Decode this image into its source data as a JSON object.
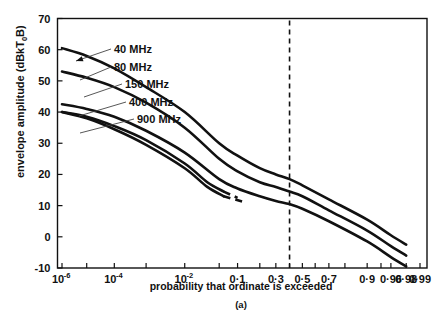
{
  "chart_data": {
    "type": "line",
    "title": "",
    "caption": "(a)",
    "xlabel": "probability that ordinate is exceeded",
    "ylabel": "envelope amplitude  (dBkT",
    "ylabel_sub": "0",
    "ylabel_tail": "B)",
    "ylabel_full": "envelope amplitude (dBkT0B)",
    "ylim": [
      -10,
      70
    ],
    "grid": false,
    "legend_position": "inline-annotations",
    "y_ticks": [
      70,
      60,
      50,
      40,
      30,
      20,
      10,
      0,
      -10
    ],
    "y_tick_labels": [
      "70",
      "60",
      "50",
      "40",
      "30",
      "20",
      "10",
      "0",
      "-10"
    ],
    "x_scale": "probability (normal / Rayleigh paper)",
    "x_tick_labels": [
      {
        "base": "10",
        "exp": "-6",
        "p": 1e-06
      },
      {
        "base": "10",
        "exp": "-4",
        "p": 0.0001
      },
      {
        "base": "10",
        "exp": "-2",
        "p": 0.01
      },
      {
        "base": "0·1",
        "exp": "",
        "p": 0.1
      },
      {
        "base": "0·3",
        "exp": "",
        "p": 0.3
      },
      {
        "base": "0·5",
        "exp": "",
        "p": 0.5
      },
      {
        "base": "0·7",
        "exp": "",
        "p": 0.7
      },
      {
        "base": "0·9",
        "exp": "",
        "p": 0.9
      },
      {
        "base": "0·96",
        "exp": "",
        "p": 0.96
      },
      {
        "base": "0·98",
        "exp": "",
        "p": 0.98
      },
      {
        "base": "0·99",
        "exp": "",
        "p": 0.99
      }
    ],
    "reference_line": {
      "label": "",
      "p": 0.4,
      "style": "dashed",
      "orientation": "vertical"
    },
    "series": [
      {
        "name": "40 MHz",
        "label": "40 MHz",
        "points": [
          {
            "p": 1e-06,
            "v": 60.5
          },
          {
            "p": 1e-05,
            "v": 58.0
          },
          {
            "p": 0.0001,
            "v": 54.0
          },
          {
            "p": 0.001,
            "v": 48.0
          },
          {
            "p": 0.01,
            "v": 40.0
          },
          {
            "p": 0.05,
            "v": 30.0
          },
          {
            "p": 0.1,
            "v": 26.0
          },
          {
            "p": 0.2,
            "v": 22.0
          },
          {
            "p": 0.3,
            "v": 20.0
          },
          {
            "p": 0.4,
            "v": 18.5
          },
          {
            "p": 0.5,
            "v": 16.5
          },
          {
            "p": 0.7,
            "v": 12.0
          },
          {
            "p": 0.9,
            "v": 5.5
          },
          {
            "p": 0.96,
            "v": 0.5
          },
          {
            "p": 0.98,
            "v": -2.5
          }
        ]
      },
      {
        "name": "80 MHz",
        "label": "80 MHz",
        "points": [
          {
            "p": 1e-06,
            "v": 53.0
          },
          {
            "p": 1e-05,
            "v": 51.0
          },
          {
            "p": 0.0001,
            "v": 48.0
          },
          {
            "p": 0.001,
            "v": 43.0
          },
          {
            "p": 0.01,
            "v": 35.0
          },
          {
            "p": 0.05,
            "v": 25.0
          },
          {
            "p": 0.1,
            "v": 21.0
          },
          {
            "p": 0.2,
            "v": 17.5
          },
          {
            "p": 0.3,
            "v": 16.0
          },
          {
            "p": 0.4,
            "v": 14.5
          },
          {
            "p": 0.5,
            "v": 13.0
          },
          {
            "p": 0.7,
            "v": 8.5
          },
          {
            "p": 0.9,
            "v": 2.0
          },
          {
            "p": 0.96,
            "v": -3.0
          },
          {
            "p": 0.98,
            "v": -6.0
          }
        ]
      },
      {
        "name": "150 MHz",
        "label": "150 MHz",
        "points": [
          {
            "p": 1e-06,
            "v": 42.5
          },
          {
            "p": 1e-05,
            "v": 41.0
          },
          {
            "p": 0.0001,
            "v": 38.5
          },
          {
            "p": 0.001,
            "v": 34.0
          },
          {
            "p": 0.01,
            "v": 27.0
          },
          {
            "p": 0.05,
            "v": 18.5
          },
          {
            "p": 0.1,
            "v": 15.5
          },
          {
            "p": 0.2,
            "v": 13.0
          },
          {
            "p": 0.3,
            "v": 11.5
          },
          {
            "p": 0.4,
            "v": 10.5
          },
          {
            "p": 0.5,
            "v": 9.0
          },
          {
            "p": 0.7,
            "v": 5.0
          },
          {
            "p": 0.9,
            "v": -1.5
          },
          {
            "p": 0.96,
            "v": -6.5
          },
          {
            "p": 0.98,
            "v": -9.5
          }
        ]
      },
      {
        "name": "400 MHz",
        "label": "400 MHz",
        "dashed_tail": true,
        "points": [
          {
            "p": 1e-06,
            "v": 40.0
          },
          {
            "p": 1e-05,
            "v": 38.5
          },
          {
            "p": 0.0001,
            "v": 35.5
          },
          {
            "p": 0.001,
            "v": 31.0
          },
          {
            "p": 0.01,
            "v": 23.5
          },
          {
            "p": 0.03,
            "v": 17.5
          },
          {
            "p": 0.06,
            "v": 14.5
          },
          {
            "p": 0.1,
            "v": 12.5
          }
        ]
      },
      {
        "name": "900 MHz",
        "label": "900 MHz",
        "dashed_tail": true,
        "points": [
          {
            "p": 1e-06,
            "v": 40.0
          },
          {
            "p": 1e-05,
            "v": 38.0
          },
          {
            "p": 0.0001,
            "v": 34.5
          },
          {
            "p": 0.001,
            "v": 29.5
          },
          {
            "p": 0.01,
            "v": 22.0
          },
          {
            "p": 0.03,
            "v": 16.0
          },
          {
            "p": 0.06,
            "v": 13.0
          },
          {
            "p": 0.13,
            "v": 11.0
          }
        ]
      }
    ],
    "annotations": [
      {
        "text": "40 MHz",
        "lx": 111,
        "ly": 49,
        "tx": 76,
        "ty": 61,
        "arrow": true
      },
      {
        "text": "80 MHz",
        "lx": 111,
        "ly": 67,
        "tx": 80,
        "ty": 80,
        "arrow": false
      },
      {
        "text": "150 MHz",
        "lx": 122,
        "ly": 84,
        "tx": 84,
        "ty": 97,
        "arrow": false
      },
      {
        "text": "400 MHz",
        "lx": 126,
        "ly": 102,
        "tx": 79,
        "ty": 116,
        "arrow": false
      },
      {
        "text": "900 MHz",
        "lx": 134,
        "ly": 119,
        "tx": 80,
        "ty": 133,
        "arrow": false
      }
    ]
  },
  "colors": {
    "ink": "#111111",
    "background": "#ffffff",
    "leader": "#444444"
  }
}
